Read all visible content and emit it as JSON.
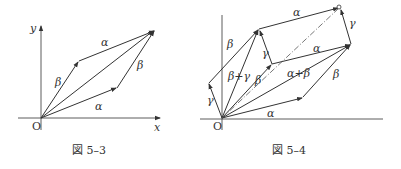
{
  "figures": [
    {
      "caption": "図 5–3",
      "axis_labels": {
        "x": "x",
        "y": "y",
        "origin": "O"
      },
      "vector_labels": {
        "alpha_bottom": "α",
        "alpha_top": "α",
        "beta_left": "β",
        "beta_right": "β"
      }
    },
    {
      "caption": "図 5–4",
      "axis_labels": {
        "origin": "O"
      },
      "vector_labels": {
        "alpha_bottom": "α",
        "alpha_mid": "α",
        "alpha_top": "α",
        "beta_left": "β",
        "beta_inner": "β",
        "beta_right": "β",
        "gamma_left": "γ",
        "gamma_mid": "γ",
        "gamma_right": "γ",
        "beta_plus_gamma": "β+γ",
        "alpha_plus_beta": "α+β"
      }
    }
  ],
  "colors": {
    "line": "#333333",
    "dash": "#555555"
  }
}
